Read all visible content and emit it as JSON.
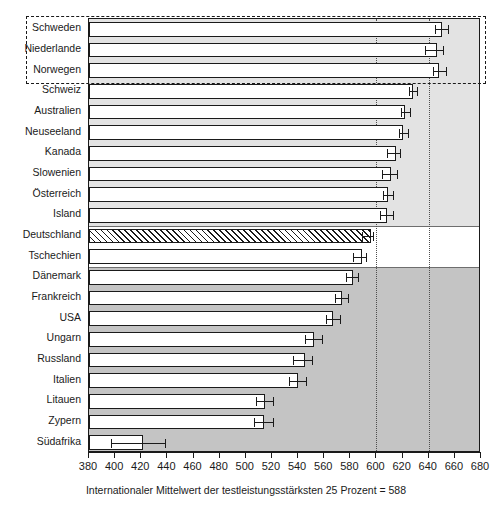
{
  "figure": {
    "title_faint": "",
    "caption": "Internationaler Mittelwert der testleistungsstärksten 25 Prozent = 588"
  },
  "axis": {
    "ticks": [
      380,
      400,
      420,
      440,
      460,
      480,
      500,
      520,
      540,
      560,
      580,
      600,
      620,
      640,
      660,
      680
    ],
    "tick_labels": [
      "380",
      "400",
      "420",
      "440",
      "460",
      "480",
      "500",
      "520",
      "540",
      "560",
      "580",
      "600",
      "620",
      "640",
      "660",
      "680"
    ],
    "min": 380,
    "max": 680,
    "gridlines": [
      600,
      640
    ]
  },
  "colors": {
    "band_above": "#e3e3e3",
    "band_same": "#ffffff",
    "band_below": "#c4c4c4",
    "bar_fill": "#ffffff",
    "bar_stroke": "#1a1a1a",
    "grid": "#4d4d4d"
  },
  "chart_data": {
    "type": "bar",
    "orientation": "horizontal",
    "title": "",
    "xlabel": "Internationaler Mittelwert der testleistungsstärksten 25 Prozent = 588",
    "ylabel": "",
    "xlim": [
      380,
      680
    ],
    "grid": true,
    "reference_value": 588,
    "categories": [
      "Schweden",
      "Niederlande",
      "Norwegen",
      "Schweiz",
      "Australien",
      "Neuseeland",
      "Kanada",
      "Slowenien",
      "Österreich",
      "Island",
      "Deutschland",
      "Tschechien",
      "Dänemark",
      "Frankreich",
      "USA",
      "Ungarn",
      "Russland",
      "Italien",
      "Litauen",
      "Zypern",
      "Südafrika"
    ],
    "values": [
      650,
      646,
      648,
      628,
      622,
      620,
      615,
      611,
      609,
      608,
      596,
      589,
      582,
      574,
      567,
      552,
      545,
      540,
      515,
      514,
      421
    ],
    "error_low": [
      645,
      637,
      643,
      625,
      619,
      617,
      608,
      604,
      605,
      603,
      589,
      582,
      577,
      568,
      561,
      545,
      536,
      533,
      508,
      506,
      397
    ],
    "error_high": [
      655,
      651,
      653,
      631,
      626,
      624,
      618,
      616,
      613,
      613,
      597,
      592,
      586,
      578,
      572,
      558,
      551,
      546,
      521,
      521,
      438
    ],
    "significance_groups": [
      {
        "label": "signifikant über dem Mittelwert",
        "fill": "#e3e3e3",
        "categories": [
          "Schweden",
          "Niederlande",
          "Norwegen",
          "Schweiz",
          "Australien",
          "Neuseeland",
          "Kanada",
          "Slowenien",
          "Österreich",
          "Island"
        ]
      },
      {
        "label": "nicht signifikant verschieden",
        "fill": "#ffffff",
        "categories": [
          "Deutschland",
          "Tschechien"
        ]
      },
      {
        "label": "signifikant unter dem Mittelwert",
        "fill": "#c4c4c4",
        "categories": [
          "Dänemark",
          "Frankreich",
          "USA",
          "Ungarn",
          "Russland",
          "Italien",
          "Litauen",
          "Zypern",
          "Südafrika"
        ]
      }
    ],
    "highlighted_categories": [
      "Schweden",
      "Niederlande",
      "Norwegen"
    ],
    "hatched_categories": [
      "Deutschland"
    ]
  }
}
